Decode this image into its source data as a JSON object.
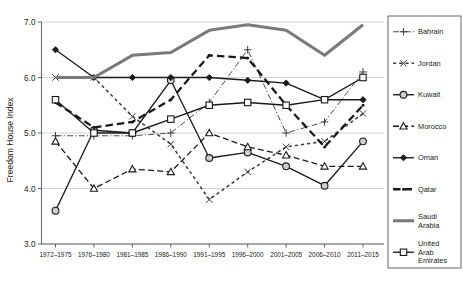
{
  "chart_data": {
    "type": "line",
    "title": "",
    "xlabel": "",
    "ylabel": "Freedom House Index",
    "ylim": [
      3.0,
      7.0
    ],
    "yticks": [
      "3.0",
      "4.0",
      "5.0",
      "6.0",
      "7.0"
    ],
    "grid": true,
    "legend_position": "right",
    "categories": [
      "1972–1975",
      "1976–1980",
      "1981–1985",
      "1986–1990",
      "1991–1995",
      "1996–2000",
      "2001–2005",
      "2006–2010",
      "2011–2015"
    ],
    "series": [
      {
        "name": "Bahrain",
        "marker": "plus",
        "dash": "dash-dot",
        "color": "#3a3a3a",
        "values": [
          4.95,
          4.95,
          4.95,
          5.0,
          5.55,
          6.5,
          5.0,
          5.2,
          6.1
        ]
      },
      {
        "name": "Jordan",
        "marker": "x",
        "dash": "dotted",
        "color": "#3a3a3a",
        "values": [
          6.0,
          6.0,
          5.3,
          4.8,
          3.8,
          4.3,
          4.75,
          4.85,
          5.35
        ]
      },
      {
        "name": "Kuwait",
        "marker": "circle",
        "dash": "solid",
        "color": "#1a1a1a",
        "values": [
          3.6,
          5.05,
          5.0,
          5.95,
          4.55,
          4.65,
          4.4,
          4.05,
          4.85
        ]
      },
      {
        "name": "Morocco",
        "marker": "triangle",
        "dash": "dashed",
        "color": "#1a1a1a",
        "values": [
          4.85,
          4.0,
          4.35,
          4.3,
          5.0,
          4.75,
          4.6,
          4.4,
          4.4
        ]
      },
      {
        "name": "Oman",
        "marker": "diamond",
        "dash": "solid",
        "color": "#1a1a1a",
        "values": [
          6.5,
          6.0,
          6.0,
          6.0,
          6.0,
          5.95,
          5.9,
          5.6,
          5.6
        ]
      },
      {
        "name": "Qatar",
        "marker": "dot",
        "dash": "dashed-heavy",
        "color": "#1a1a1a",
        "values": [
          5.55,
          5.1,
          5.2,
          5.6,
          6.4,
          6.35,
          5.5,
          4.75,
          5.5
        ]
      },
      {
        "name": "Saudi Arabia",
        "marker": "none",
        "dash": "solid-thick",
        "color": "#7a7a7a",
        "values": [
          6.0,
          6.0,
          6.4,
          6.45,
          6.85,
          6.95,
          6.85,
          6.4,
          6.95
        ]
      },
      {
        "name": "United Arab Emirates",
        "marker": "square",
        "dash": "solid",
        "color": "#1a1a1a",
        "values": [
          5.6,
          5.0,
          5.0,
          5.25,
          5.5,
          5.55,
          5.5,
          5.6,
          6.0
        ]
      }
    ]
  },
  "legend": {
    "items": [
      {
        "label": "Bahrain"
      },
      {
        "label": "Jordan"
      },
      {
        "label": "Kuwait"
      },
      {
        "label": "Morocco"
      },
      {
        "label": "Oman"
      },
      {
        "label": "Qatar"
      },
      {
        "label": "Saudi Arabia",
        "line2": ""
      },
      {
        "label": "United Arab Emirates"
      }
    ],
    "wrapped": {
      "saudi_line1": "Saudi",
      "saudi_line2": "Arabia",
      "uae_line1": "United",
      "uae_line2": "Arab",
      "uae_line3": "Emirates"
    }
  }
}
